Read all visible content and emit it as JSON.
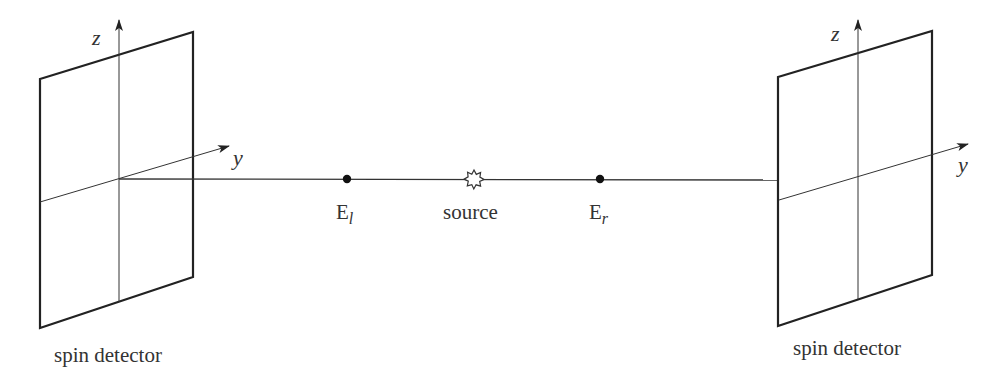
{
  "diagram": {
    "type": "spin-measurement-setup",
    "colors": {
      "line": "#333333",
      "frame": "#222222",
      "background": "#ffffff"
    },
    "left_detector": {
      "label": "spin detector",
      "axes": {
        "z": "z",
        "y": "y"
      }
    },
    "right_detector": {
      "label": "spin detector",
      "axes": {
        "z": "z",
        "y": "y"
      }
    },
    "beam": {
      "points": [
        {
          "id": "E_l",
          "base": "E",
          "subscript": "l"
        },
        {
          "id": "source",
          "label": "source",
          "icon": "star-burst-icon"
        },
        {
          "id": "E_r",
          "base": "E",
          "subscript": "r"
        }
      ]
    }
  }
}
